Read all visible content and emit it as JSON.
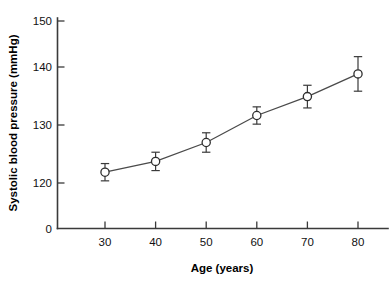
{
  "chart_data": {
    "type": "line",
    "title": "",
    "xlabel": "Age (years)",
    "ylabel": "Systolic blood pressure (mmHg)",
    "x": [
      30,
      40,
      50,
      60,
      70,
      80
    ],
    "xticklabels": [
      "30",
      "40",
      "50",
      "60",
      "70",
      "80"
    ],
    "yticklabels": [
      "0",
      "120",
      "130",
      "140",
      "150"
    ],
    "yticks": [
      0,
      120,
      130,
      140,
      150
    ],
    "xlim": [
      22,
      86
    ],
    "ylim": [
      118,
      152
    ],
    "grid": false,
    "legend": null,
    "axis_break": true,
    "series": [
      {
        "name": "Systolic blood pressure",
        "marker": "open-circle",
        "values": [
          122.0,
          124.0,
          127.5,
          132.5,
          136.0,
          140.2
        ],
        "errors": [
          1.6,
          1.7,
          1.8,
          1.6,
          2.1,
          3.2
        ]
      }
    ],
    "colors": {
      "line": "#4a4a4a",
      "marker_face": "#ffffff",
      "marker_edge": "#2e2e2e",
      "axis": "#3a3a3a",
      "text": "#111111"
    }
  }
}
